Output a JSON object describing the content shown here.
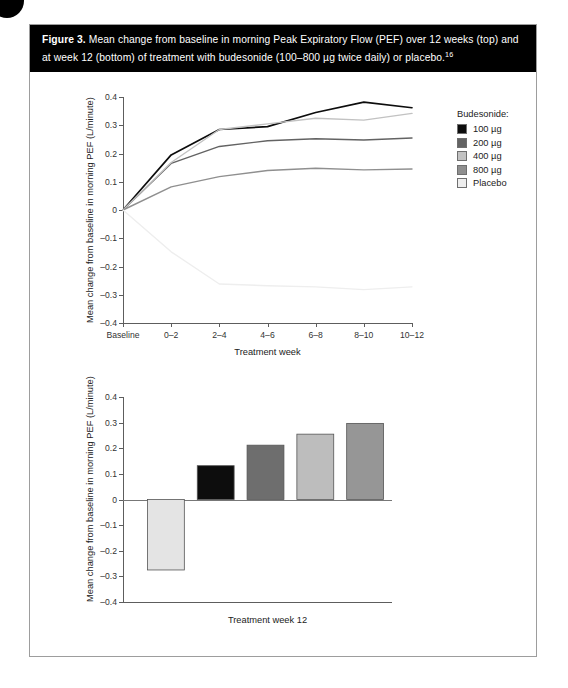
{
  "figure": {
    "caption_prefix": "Figure 3.",
    "caption_text": " Mean change from baseline in morning Peak Expiratory Flow (PEF) over 12 weeks (top) and at week 12 (bottom) of treatment with budesonide (100–800 µg twice daily) or placebo.",
    "caption_reference": "16"
  },
  "legend": {
    "title": "Budesonide:",
    "items": [
      {
        "label": "100 µg",
        "color": "#0d0d0d"
      },
      {
        "label": "200 µg",
        "color": "#636363"
      },
      {
        "label": "400 µg",
        "color": "#c2c2c2"
      },
      {
        "label": "800 µg",
        "color": "#8f8f8f"
      },
      {
        "label": "Placebo",
        "color": "#eeeeee"
      }
    ]
  },
  "chart_data": [
    {
      "id": "top-line-chart",
      "type": "line",
      "title": "",
      "xlabel": "Treatment week",
      "ylabel": "Mean change from baseline in morning PEF (L/minute)",
      "categories": [
        "Baseline",
        "0–2",
        "2–4",
        "4–6",
        "6–8",
        "8–10",
        "10–12"
      ],
      "ylim": [
        -0.4,
        0.4
      ],
      "yticks": [
        "0.4",
        "0.3",
        "0.2",
        "0.1",
        "0",
        "–0.1",
        "–0.2",
        "–0.3",
        "–0.4"
      ],
      "ytick_values": [
        0.4,
        0.3,
        0.2,
        0.1,
        0,
        -0.1,
        -0.2,
        -0.3,
        -0.4
      ],
      "grid": false,
      "legend_position": "right",
      "series": [
        {
          "name": "100 µg",
          "color": "#0d0d0d",
          "values": [
            0,
            0.195,
            0.285,
            0.295,
            0.345,
            0.382,
            0.362
          ]
        },
        {
          "name": "200 µg",
          "color": "#636363",
          "values": [
            0,
            0.165,
            0.225,
            0.245,
            0.252,
            0.248,
            0.255
          ]
        },
        {
          "name": "400 µg",
          "color": "#c2c2c2",
          "values": [
            0,
            0.168,
            0.285,
            0.305,
            0.325,
            0.318,
            0.342
          ]
        },
        {
          "name": "800 µg",
          "color": "#8f8f8f",
          "values": [
            0,
            0.082,
            0.118,
            0.14,
            0.148,
            0.142,
            0.145
          ]
        },
        {
          "name": "Placebo",
          "color": "#eeeeee",
          "values": [
            0,
            -0.148,
            -0.262,
            -0.268,
            -0.272,
            -0.282,
            -0.272
          ]
        }
      ]
    },
    {
      "id": "bottom-bar-chart",
      "type": "bar",
      "title": "",
      "xlabel": "Treatment week 12",
      "ylabel": "Mean change from baseline in morning PEF (L/minute)",
      "categories": [
        "Placebo",
        "100 µg",
        "200 µg",
        "400 µg",
        "800 µg"
      ],
      "values": [
        -0.275,
        0.132,
        0.212,
        0.255,
        0.297
      ],
      "colors": [
        "#e4e4e4",
        "#0d0d0d",
        "#6e6e6e",
        "#bdbdbd",
        "#969696"
      ],
      "ylim": [
        -0.4,
        0.4
      ],
      "yticks": [
        "0.4",
        "0.3",
        "0.2",
        "0.1",
        "0",
        "–0.1",
        "–0.2",
        "–0.3",
        "–0.4"
      ],
      "ytick_values": [
        0.4,
        0.3,
        0.2,
        0.1,
        0,
        -0.1,
        -0.2,
        -0.3,
        -0.4
      ],
      "grid": false,
      "legend_position": "none"
    }
  ]
}
